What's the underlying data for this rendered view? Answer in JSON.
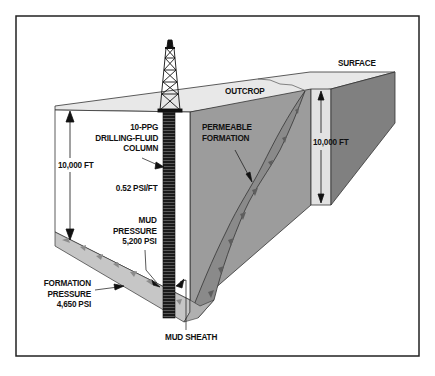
{
  "figure": {
    "colors": {
      "frame": "#222222",
      "background": "#ffffff",
      "surface_top": "#e6e6e6",
      "front_face": "#ffffff",
      "formation_wall": "#9a9a9a",
      "right_side_face": "#7e7e7e",
      "right_pillar_front": "#e2e2e2",
      "permeable_bed": "#8a8a8a",
      "permeable_speckle": "#5e5e5e",
      "bottom_bed": "#c4c4c4",
      "bottom_speckle": "#8c8c8c",
      "drill_column": "#1a1a1a",
      "text": "#111111"
    },
    "labels": {
      "surface": "SURFACE",
      "outcrop": "OUTCROP",
      "permeable_formation": [
        "PERMEABLE",
        "FORMATION"
      ],
      "drilling_fluid": [
        "10-PPG",
        "DRILLING-FLUID",
        "COLUMN"
      ],
      "depth_left": "10,000 FT",
      "depth_right": "10,000 FT",
      "gradient": "0.52 PSI/FT",
      "mud_pressure": [
        "MUD",
        "PRESSURE",
        "5,200 PSI"
      ],
      "formation_pressure": [
        "FORMATION",
        "PRESSURE",
        "4,650 PSI"
      ],
      "mud_sheath": "MUD SHEATH"
    },
    "icons": {
      "derrick": "drilling-derrick-icon"
    }
  }
}
